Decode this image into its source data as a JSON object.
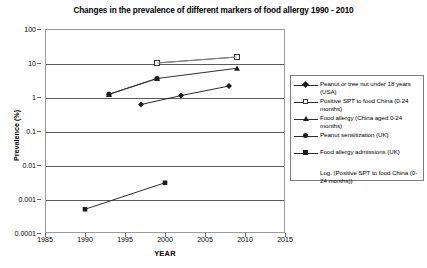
{
  "chart_data": {
    "type": "line",
    "title": "Changes in the prevalence of different markers of food allergy 1990 - 2010",
    "xlabel": "YEAR",
    "ylabel": "Prevalence (%)",
    "xlim": [
      1985,
      2015
    ],
    "ylim": [
      0.0001,
      100
    ],
    "yscale": "log",
    "grid": true,
    "legend_position": "right",
    "x_ticks": [
      1985,
      1990,
      1995,
      2000,
      2005,
      2010,
      2015
    ],
    "x_tick_labels": [
      "1985",
      "1990",
      "1995",
      "2000",
      "2005",
      "2010",
      "2015"
    ],
    "y_ticks": [
      0.0001,
      0.001,
      0.01,
      0.1,
      1,
      10,
      100
    ],
    "y_tick_labels": [
      "0.0001",
      "0.001",
      "0.01",
      "0.1",
      "1",
      "10",
      "100"
    ],
    "series": [
      {
        "name": "Peanut or tree nut under 18 years (USA)",
        "marker": "diamond",
        "points": [
          {
            "x": 1997,
            "y": 0.6
          },
          {
            "x": 2002,
            "y": 1.1
          },
          {
            "x": 2008,
            "y": 2.1
          }
        ]
      },
      {
        "name": "Positive SPT to food China (0-24 months)",
        "marker": "square-open",
        "points": [
          {
            "x": 1999,
            "y": 10
          },
          {
            "x": 2009,
            "y": 15
          }
        ]
      },
      {
        "name": "Food allergy (China aged 0-24 months)",
        "marker": "triangle",
        "points": [
          {
            "x": 1993,
            "y": 1.2
          },
          {
            "x": 1999,
            "y": 3.5
          },
          {
            "x": 2009,
            "y": 7.0
          }
        ]
      },
      {
        "name": "Peanut sensitization (UK)",
        "marker": "circle",
        "points": [
          {
            "x": 1993,
            "y": 1.2
          },
          {
            "x": 1999,
            "y": 3.5
          }
        ]
      },
      {
        "name": "Food allergy admissions (UK)",
        "marker": "square-filled",
        "points": [
          {
            "x": 1990,
            "y": 0.0005
          },
          {
            "x": 2000,
            "y": 0.003
          }
        ]
      },
      {
        "name": "Log. (Positive SPT to food China (0-24 months))",
        "marker": "none",
        "trendline": true,
        "points": [
          {
            "x": 1999,
            "y": 10
          },
          {
            "x": 2009,
            "y": 15
          }
        ]
      }
    ]
  },
  "legend": {
    "items": [
      {
        "label": "Peanut or tree nut under 18 years (USA)",
        "marker": "diamond"
      },
      {
        "label": "Positive SPT to food China (0-24 months)",
        "marker": "square-open"
      },
      {
        "label": "Food allergy (China aged 0-24 months)",
        "marker": "triangle"
      },
      {
        "label": "Peanut sensitization (UK)",
        "marker": "circle"
      },
      {
        "label": "Food allergy admissions (UK)",
        "marker": "square-filled"
      },
      {
        "label": "Log. (Positive SPT to food China (0-24 months))",
        "marker": "none"
      }
    ]
  },
  "colors": {
    "series_line": "#2f2f2f",
    "gridline": "#5a5a5a",
    "frame": "#9a9a9a",
    "trendline": "#9b9b9b"
  }
}
